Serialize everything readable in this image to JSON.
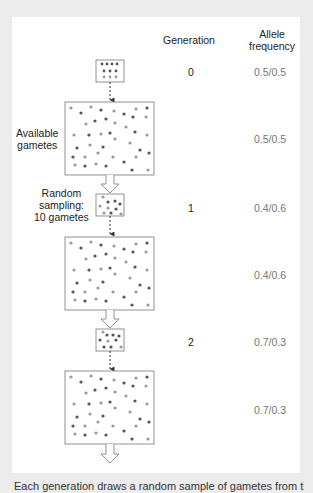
{
  "headers": {
    "generation": "Generation",
    "allele_line1": "Allele",
    "allele_line2": "frequency"
  },
  "labels": {
    "available_line1": "Available",
    "available_line2": "gametes",
    "random_line1": "Random",
    "random_line2": "sampling:",
    "random_line3": "10 gametes"
  },
  "rows": [
    {
      "generation": "0",
      "sample_frequency": "0.5/0.5",
      "pool_frequency": "0.5/0.5"
    },
    {
      "generation": "1",
      "sample_frequency": "0.4/0.6",
      "pool_frequency": "0.4/0.6"
    },
    {
      "generation": "2",
      "sample_frequency": "0.7/0.3",
      "pool_frequency": "0.7/0.3"
    }
  ],
  "caption": "Each generation draws a random sample of gametes from the pool",
  "colors": {
    "background": "#ececec",
    "panel": "#ffffff",
    "allele_dark": "#555555",
    "allele_light": "#9a9a9a",
    "box_stroke": "#777777"
  }
}
